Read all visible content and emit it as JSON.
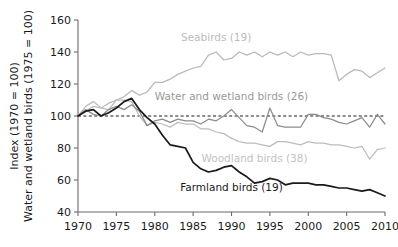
{
  "chart_data": {
    "type": "line",
    "title": "",
    "xlabel": "",
    "ylabel": "Index (1970 = 100)\nWater and wetland birds (1975 = 100)",
    "ylabel_line1": "Index (1970 = 100)",
    "ylabel_line2": "Water and wetland birds (1975 = 100)",
    "xlim": [
      1970,
      2010
    ],
    "ylim": [
      40,
      160
    ],
    "xticks": [
      1970,
      1975,
      1980,
      1985,
      1990,
      1995,
      2000,
      2005,
      2010
    ],
    "yticks": [
      40,
      60,
      80,
      100,
      120,
      140,
      160
    ],
    "grid": false,
    "legend": "inline-annotations",
    "reference_line": {
      "label": "index = 100",
      "value": 100,
      "style": "dashed",
      "color": "#1a1a1a"
    },
    "x": [
      1970,
      1971,
      1972,
      1973,
      1974,
      1975,
      1976,
      1977,
      1978,
      1979,
      1980,
      1981,
      1982,
      1983,
      1984,
      1985,
      1986,
      1987,
      1988,
      1989,
      1990,
      1991,
      1992,
      1993,
      1994,
      1995,
      1996,
      1997,
      1998,
      1999,
      2000,
      2001,
      2002,
      2003,
      2004,
      2005,
      2006,
      2007,
      2008,
      2009,
      2010
    ],
    "series": [
      {
        "name": "Seabirds (19)",
        "count": 19,
        "color": "#b9b9b9",
        "label_x": 1988,
        "label_y": 147,
        "values": [
          100,
          103,
          106,
          105,
          108,
          110,
          112,
          116,
          113,
          115,
          121,
          121,
          123,
          126,
          128,
          130,
          131,
          138,
          140,
          135,
          136,
          140,
          138,
          140,
          137,
          140,
          138,
          140,
          137,
          140,
          138,
          139,
          139,
          138,
          122,
          126,
          129,
          128,
          124,
          127,
          130
        ]
      },
      {
        "name": "Water and wetland birds (26)",
        "count": 26,
        "color": "#8c8c8c",
        "label_x": 1990,
        "label_y": 110,
        "values": [
          100,
          104,
          101,
          100,
          104,
          106,
          104,
          107,
          103,
          94,
          97,
          98,
          96,
          98,
          97,
          97,
          95,
          98,
          97,
          100,
          104,
          99,
          94,
          93,
          90,
          105,
          94,
          93,
          93,
          93,
          101,
          101,
          99,
          98,
          96,
          95,
          97,
          99,
          93,
          101,
          95
        ]
      },
      {
        "name": "Woodland birds (38)",
        "count": 38,
        "color": "#bdbdbd",
        "label_x": 1993,
        "label_y": 71,
        "values": [
          100,
          106,
          109,
          105,
          104,
          110,
          110,
          109,
          100,
          94,
          96,
          95,
          93,
          96,
          95,
          95,
          92,
          92,
          90,
          89,
          86,
          84,
          83,
          83,
          82,
          81,
          84,
          84,
          83,
          82,
          84,
          83,
          83,
          82,
          82,
          81,
          80,
          81,
          73,
          79,
          80
        ]
      },
      {
        "name": "Farmland birds (19)",
        "count": 19,
        "color": "#1a1a1a",
        "label_x": 1990,
        "label_y": 53,
        "values": [
          100,
          103,
          104,
          100,
          102,
          105,
          109,
          111,
          104,
          99,
          95,
          88,
          82,
          81,
          80,
          71,
          67,
          65,
          66,
          68,
          69,
          65,
          62,
          58,
          59,
          61,
          60,
          57,
          58,
          58,
          58,
          57,
          57,
          56,
          55,
          55,
          54,
          53,
          54,
          52,
          50
        ]
      }
    ]
  },
  "axis": {
    "y_title_line1": "Index (1970 = 100)",
    "y_title_line2": "Water and wetland birds (1975 = 100)",
    "x_tick_labels": [
      "1970",
      "1975",
      "1980",
      "1985",
      "1990",
      "1995",
      "2000",
      "2005",
      "2010"
    ],
    "y_tick_labels": [
      "160",
      "140",
      "120",
      "100",
      "80",
      "60",
      "40"
    ]
  }
}
